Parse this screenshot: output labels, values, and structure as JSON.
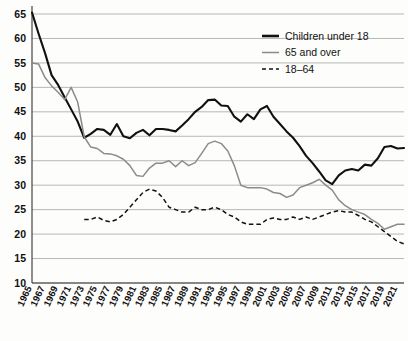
{
  "chart_data": {
    "type": "line",
    "title": "",
    "xlabel": "",
    "ylabel": "",
    "ylim": [
      10,
      65
    ],
    "yticks": [
      10,
      15,
      20,
      25,
      30,
      35,
      40,
      45,
      50,
      55,
      60,
      65
    ],
    "grid": true,
    "legend_position": "top-right",
    "xlim": [
      1965,
      2022
    ],
    "xtick_labels": [
      "1965",
      "1967",
      "1969",
      "1971",
      "1973",
      "1975",
      "1977",
      "1979",
      "1981",
      "1983",
      "1985",
      "1987",
      "1989",
      "1991",
      "1993",
      "1995",
      "1997",
      "1999",
      "2001",
      "2003",
      "2005",
      "2007",
      "2009",
      "2011",
      "2013",
      "2015",
      "2017",
      "2019",
      "2021"
    ],
    "x": [
      1965,
      1966,
      1967,
      1968,
      1969,
      1970,
      1971,
      1972,
      1973,
      1974,
      1975,
      1976,
      1977,
      1978,
      1979,
      1980,
      1981,
      1982,
      1983,
      1984,
      1985,
      1986,
      1987,
      1988,
      1989,
      1990,
      1991,
      1992,
      1993,
      1994,
      1995,
      1996,
      1997,
      1998,
      1999,
      2000,
      2001,
      2002,
      2003,
      2004,
      2005,
      2006,
      2007,
      2008,
      2009,
      2010,
      2011,
      2012,
      2013,
      2014,
      2015,
      2016,
      2017,
      2018,
      2019,
      2020,
      2021,
      2022
    ],
    "series": [
      {
        "name": "Children under 18",
        "color": "#111111",
        "style": "solid",
        "values": [
          65.3,
          61.0,
          57.0,
          52.5,
          50.5,
          48.0,
          45.5,
          43.0,
          39.7,
          40.5,
          41.5,
          41.3,
          40.3,
          42.5,
          40.0,
          39.6,
          40.7,
          41.3,
          40.2,
          41.5,
          41.5,
          41.3,
          41.0,
          42.2,
          43.5,
          45.0,
          46.0,
          47.4,
          47.5,
          46.3,
          46.2,
          44.0,
          43.0,
          44.5,
          43.5,
          45.5,
          46.2,
          44.0,
          42.5,
          41.0,
          39.7,
          38.0,
          36.0,
          34.5,
          32.8,
          31.0,
          30.2,
          32.0,
          33.0,
          33.3,
          33.0,
          34.2,
          34.0,
          35.5,
          37.8,
          38.0,
          37.5,
          37.6
        ]
      },
      {
        "name": "65 and over",
        "color": "#8b8b8b",
        "style": "solid",
        "values": [
          55.0,
          54.8,
          52.0,
          50.3,
          49.0,
          47.5,
          50.0,
          47.0,
          39.9,
          37.8,
          37.5,
          36.5,
          36.4,
          36.0,
          35.3,
          34.0,
          32.0,
          31.8,
          33.5,
          34.5,
          34.5,
          35.0,
          33.8,
          35.0,
          34.0,
          34.6,
          36.5,
          38.5,
          39.0,
          38.5,
          37.0,
          34.0,
          30.0,
          29.5,
          29.5,
          29.5,
          29.2,
          28.5,
          28.3,
          27.5,
          28.0,
          29.5,
          30.0,
          30.5,
          31.2,
          30.0,
          29.0,
          27.0,
          25.8,
          25.0,
          24.5,
          24.0,
          23.0,
          22.2,
          21.0,
          21.5,
          22.0,
          22.0
        ]
      },
      {
        "name": "18–64",
        "color": "#111111",
        "style": "dashed",
        "values": [
          null,
          null,
          null,
          null,
          null,
          null,
          null,
          null,
          23.0,
          23.0,
          23.5,
          22.8,
          22.5,
          23.0,
          24.0,
          25.5,
          27.0,
          28.5,
          29.2,
          28.8,
          27.5,
          25.5,
          25.0,
          24.5,
          24.5,
          25.5,
          25.0,
          25.0,
          25.5,
          25.0,
          24.0,
          23.5,
          22.5,
          22.0,
          22.0,
          22.0,
          23.0,
          23.3,
          23.0,
          23.0,
          23.5,
          23.0,
          23.5,
          23.0,
          23.5,
          24.0,
          24.5,
          24.8,
          24.5,
          24.5,
          23.8,
          23.0,
          22.5,
          21.5,
          20.5,
          19.5,
          18.5,
          18.0
        ]
      }
    ]
  },
  "legend": {
    "items": [
      {
        "label": "Children under 18",
        "style": "solid-thick",
        "color": "#111111"
      },
      {
        "label": "65 and over",
        "style": "solid-thin",
        "color": "#8b8b8b"
      },
      {
        "label": "18–64",
        "style": "dashed",
        "color": "#111111"
      }
    ]
  }
}
